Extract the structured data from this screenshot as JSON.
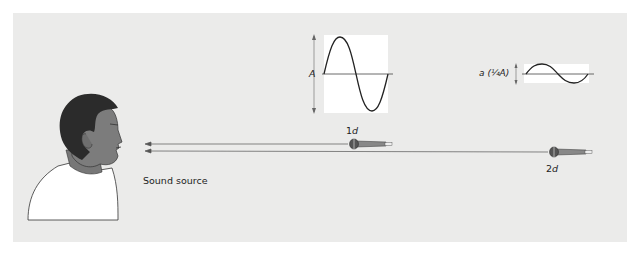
{
  "figure": {
    "source_label": "Sound source",
    "near_mic": {
      "distance_prefix": "1",
      "distance_var": "d"
    },
    "far_mic": {
      "distance_prefix": "2",
      "distance_var": "d"
    },
    "near_wave": {
      "amplitude_label": "A"
    },
    "far_wave": {
      "amplitude_label": "a (¼A)"
    }
  },
  "colors": {
    "background": "#ebebea",
    "wave_box": "#ffffff",
    "skin": "#7a7a7a",
    "hair": "#2e2e2e",
    "shirt": "#ffffff",
    "line": "#333333"
  },
  "icons": [
    "person-icon",
    "microphone-icon",
    "arrow-icon",
    "sine-wave-icon"
  ]
}
